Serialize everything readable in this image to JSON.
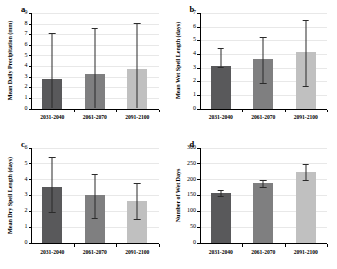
{
  "figure": {
    "categories": [
      "2031-2040",
      "2061-2070",
      "2091-2100"
    ],
    "bar_colors": [
      "#59595b",
      "#7f7f80",
      "#c0c0c0"
    ],
    "panels": [
      {
        "letter": "a",
        "ylabel": "Mean Daily Precipitation (mm)",
        "ylim": [
          0,
          9
        ],
        "yticks": [
          0,
          1,
          2,
          3,
          4,
          5,
          6,
          7,
          8,
          9
        ],
        "ytick_labels": [
          "0",
          "1",
          "2",
          "3",
          "4",
          "5",
          "6",
          "7",
          "8",
          "9"
        ],
        "values": [
          2.8,
          3.25,
          3.7
        ],
        "err_low": [
          0.05,
          0.05,
          0.05
        ],
        "err_high": [
          7.1,
          7.6,
          8.1
        ]
      },
      {
        "letter": "b",
        "ylabel": "Mean Wet Spell Length (days)",
        "ylim": [
          0,
          7
        ],
        "yticks": [
          0,
          1,
          2,
          3,
          4,
          5,
          6,
          7
        ],
        "ytick_labels": [
          "0",
          "1",
          "2",
          "3",
          "4",
          "5",
          "6",
          "7"
        ],
        "values": [
          3.1,
          3.6,
          4.15
        ],
        "err_low": [
          3.05,
          1.9,
          1.65
        ],
        "err_high": [
          4.4,
          5.25,
          6.5
        ]
      },
      {
        "letter": "c",
        "ylabel": "Mean Dry Spell Length (days)",
        "ylim": [
          0,
          6
        ],
        "yticks": [
          0,
          1,
          2,
          3,
          4,
          5,
          6
        ],
        "ytick_labels": [
          "0",
          "1",
          "2",
          "3",
          "4",
          "5",
          "6"
        ],
        "values": [
          3.55,
          3.0,
          2.65
        ],
        "err_low": [
          1.95,
          1.55,
          1.5
        ],
        "err_high": [
          5.4,
          4.35,
          3.8
        ]
      },
      {
        "letter": "d",
        "ylabel": "Number of Wet Days",
        "ylim": [
          0,
          300
        ],
        "yticks": [
          0,
          50,
          100,
          150,
          200,
          250,
          300
        ],
        "ytick_labels": [
          "0",
          "50",
          "100",
          "150",
          "200",
          "250",
          "300"
        ],
        "values": [
          158,
          188,
          223
        ],
        "err_low": [
          149,
          176,
          197
        ],
        "err_high": [
          168,
          199,
          249
        ]
      }
    ]
  },
  "chart_data": {
    "type": "bar",
    "title": "",
    "categories": [
      "2031-2040",
      "2061-2070",
      "2091-2100"
    ],
    "panels": [
      {
        "panel": "a",
        "type": "bar",
        "title": "",
        "xlabel": "",
        "ylabel": "Mean Daily Precipitation (mm)",
        "ylim": [
          0,
          9
        ],
        "yticks": [
          0,
          1,
          2,
          3,
          4,
          5,
          6,
          7,
          8,
          9
        ],
        "categories": [
          "2031-2040",
          "2061-2070",
          "2091-2100"
        ],
        "values": [
          2.8,
          3.25,
          3.7
        ],
        "error_bars": {
          "lower": [
            0.05,
            0.05,
            0.05
          ],
          "upper": [
            7.1,
            7.6,
            8.1
          ]
        },
        "grid": true,
        "legend": "none"
      },
      {
        "panel": "b",
        "type": "bar",
        "title": "",
        "xlabel": "",
        "ylabel": "Mean Wet Spell Length (days)",
        "ylim": [
          0,
          7
        ],
        "yticks": [
          0,
          1,
          2,
          3,
          4,
          5,
          6,
          7
        ],
        "categories": [
          "2031-2040",
          "2061-2070",
          "2091-2100"
        ],
        "values": [
          3.1,
          3.6,
          4.15
        ],
        "error_bars": {
          "lower": [
            3.05,
            1.9,
            1.65
          ],
          "upper": [
            4.4,
            5.25,
            6.5
          ]
        },
        "grid": true,
        "legend": "none"
      },
      {
        "panel": "c",
        "type": "bar",
        "title": "",
        "xlabel": "",
        "ylabel": "Mean Dry Spell Length (days)",
        "ylim": [
          0,
          6
        ],
        "yticks": [
          0,
          1,
          2,
          3,
          4,
          5,
          6
        ],
        "categories": [
          "2031-2040",
          "2061-2070",
          "2091-2100"
        ],
        "values": [
          3.55,
          3.0,
          2.65
        ],
        "error_bars": {
          "lower": [
            1.95,
            1.55,
            1.5
          ],
          "upper": [
            5.4,
            4.35,
            3.8
          ]
        },
        "grid": true,
        "legend": "none"
      },
      {
        "panel": "d",
        "type": "bar",
        "title": "",
        "xlabel": "",
        "ylabel": "Number of Wet Days",
        "ylim": [
          0,
          300
        ],
        "yticks": [
          0,
          50,
          100,
          150,
          200,
          250,
          300
        ],
        "categories": [
          "2031-2040",
          "2061-2070",
          "2091-2100"
        ],
        "values": [
          158,
          188,
          223
        ],
        "error_bars": {
          "lower": [
            149,
            176,
            197
          ],
          "upper": [
            168,
            199,
            249
          ]
        },
        "grid": true,
        "legend": "none"
      }
    ]
  }
}
